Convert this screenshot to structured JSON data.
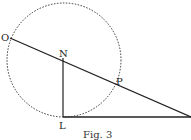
{
  "figure": {
    "caption": "Fig. 3",
    "points": {
      "O": {
        "label": "O",
        "x": 10,
        "y": 38
      },
      "N": {
        "label": "N",
        "x": 63,
        "y": 58
      },
      "P": {
        "label": "P",
        "x": 116,
        "y": 82
      },
      "L": {
        "label": "L",
        "x": 63,
        "y": 117
      },
      "E": {
        "label": "",
        "x": 191,
        "y": 117
      }
    },
    "circle": {
      "cx": 64,
      "cy": 60,
      "r": 57,
      "style": "dashed"
    },
    "segments": [
      {
        "from": "O",
        "to": "E",
        "name": "line-OP-extended"
      },
      {
        "from": "N",
        "to": "L",
        "name": "line-NL"
      },
      {
        "from": "L",
        "to": "E",
        "name": "base-line"
      }
    ],
    "colors": {
      "stroke": "#222222",
      "background": "#ffffff"
    }
  }
}
